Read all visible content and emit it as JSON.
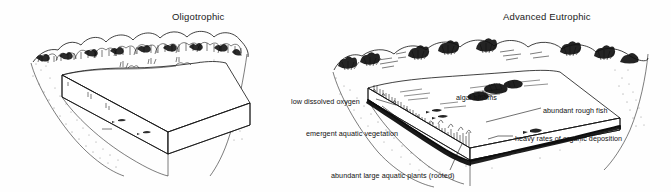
{
  "figure": {
    "background_color": "#fefefe",
    "ink_color": "#111111",
    "style": "pen-and-ink line drawing"
  },
  "panels": [
    {
      "id": "left",
      "title": "Oligotrophic",
      "description": "Clear deep lake basin with dense forested shoreline, sparse aquatic life",
      "callouts": []
    },
    {
      "id": "right",
      "title": "Advanced Eutrophic",
      "description": "Shallow filled-in lake basin with thinned shoreline vegetation, heavy plant growth and organic sediment",
      "callouts": [
        "low dissolved oxygen",
        "algal blooms",
        "abundant rough fish",
        "emergent aquatic vegetation",
        "heavy rates of organic deposition",
        "abundant large aquatic plants (rooted)"
      ]
    }
  ],
  "labels": {
    "title_left": "Oligotrophic",
    "title_right": "Advanced Eutrophic",
    "low_dissolved_oxygen": "low dissolved oxygen",
    "algal_blooms": "algal blooms",
    "abundant_rough_fish": "abundant rough fish",
    "emergent_aquatic_vegetation": "emergent aquatic vegetation",
    "heavy_rates_of_organic_deposition": "heavy rates of organic deposition",
    "abundant_large_aquatic_plants": "abundant large aquatic plants (rooted)"
  }
}
